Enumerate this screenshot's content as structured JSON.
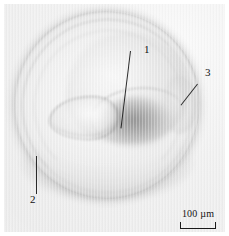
{
  "figure": {
    "type": "photomicrograph",
    "modality": "transmitted light microscopy",
    "color_mode": "grayscale",
    "background_color": "#f1f1f1",
    "plate_color": "#eeeeee",
    "annotation_color": "#2a2a2a"
  },
  "annotations": [
    {
      "label": "1",
      "target": "central aperture / umbilical region",
      "leader": "line descending to specimen centre"
    },
    {
      "label": "2",
      "target": "outer test wall at lower left",
      "leader": "vertical line rising to the rim"
    },
    {
      "label": "3",
      "target": "bulge on right-hand rim",
      "leader": "diagonal line toward lower left"
    }
  ],
  "scale_bar": {
    "value": "100",
    "unit": "µm",
    "text": "100 µm",
    "style": "bracket with end ticks"
  }
}
